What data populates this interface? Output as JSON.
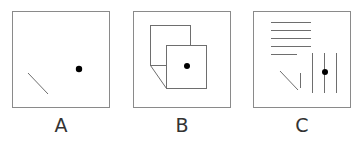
{
  "figure": {
    "panels": [
      {
        "id": "A",
        "label": "A"
      },
      {
        "id": "B",
        "label": "B"
      },
      {
        "id": "C",
        "label": "C"
      }
    ],
    "colors": {
      "frame": "#8a8a8a",
      "line": "#6e6e6e",
      "dot": "#000000",
      "label": "#333333"
    }
  }
}
